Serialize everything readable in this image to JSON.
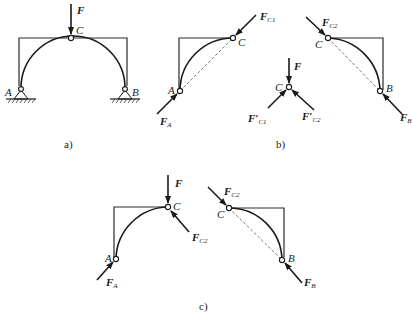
{
  "diagram": {
    "type": "three-hinged arch free-body diagrams",
    "panels": {
      "a": {
        "caption": "a)",
        "labels": {
          "force": "F",
          "hinge_top": "C",
          "support_left": "A",
          "support_right": "B"
        }
      },
      "b": {
        "caption": "b)",
        "left_piece": {
          "force_top": "F",
          "force_top_sub": "C1",
          "hinge_top": "C",
          "support": "A",
          "force_support": "F",
          "force_support_sub": "A"
        },
        "pin_c": {
          "force": "F",
          "node": "C",
          "left_force": "F′",
          "left_force_sub": "C1",
          "right_force": "F′",
          "right_force_sub": "C2"
        },
        "right_piece": {
          "force_top": "F",
          "force_top_sub": "C2",
          "hinge_top": "C",
          "support": "B",
          "force_support": "F",
          "force_support_sub": "B"
        }
      },
      "c": {
        "caption": "c)",
        "left_piece": {
          "force": "F",
          "hinge_top": "C",
          "force_c": "F",
          "force_c_sub": "C2",
          "support": "A",
          "force_support": "F",
          "force_support_sub": "A"
        },
        "right_piece": {
          "force_top": "F",
          "force_top_sub": "C2",
          "hinge_top": "C",
          "support": "B",
          "force_support": "F",
          "force_support_sub": "B"
        }
      }
    }
  }
}
